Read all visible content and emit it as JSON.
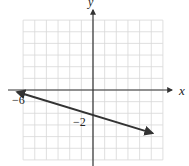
{
  "chart_data": {
    "type": "line",
    "title": "",
    "xlabel": "x",
    "ylabel": "y",
    "xlim": [
      -6,
      6
    ],
    "ylim": [
      -6,
      6
    ],
    "grid": true,
    "grid_step": 1,
    "annotations": [
      {
        "text": "−6",
        "x": -6,
        "y": 0,
        "meaning": "x-intercept"
      },
      {
        "text": "−2",
        "x": 0,
        "y": -2,
        "meaning": "y-intercept"
      }
    ],
    "series": [
      {
        "name": "line",
        "equation": "y = -x/3 - 2",
        "slope": -0.3333,
        "intercept": -2,
        "x": [
          -6.5,
          0,
          5.1
        ],
        "y": [
          -0.17,
          -2,
          -3.7
        ],
        "arrows": "both"
      }
    ]
  },
  "labels": {
    "x_axis": "x",
    "y_axis": "y",
    "x_intercept": "−6",
    "y_intercept": "−2"
  },
  "colors": {
    "grid": "#d8d8d8",
    "axis": "#333333",
    "line": "#333333"
  }
}
